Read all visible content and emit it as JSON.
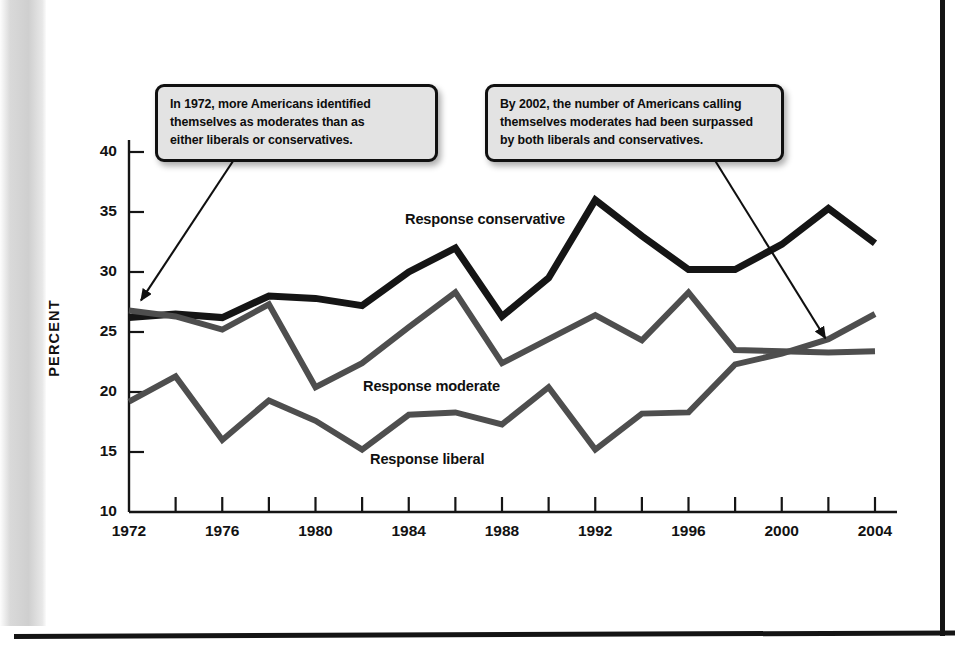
{
  "page": {
    "background_color": "#ffffff",
    "edge_color": "#141414",
    "gutter_color": "#d4d4d4"
  },
  "annotations": [
    {
      "id": "callout-1",
      "lines": [
        "In 1972, more Americans identified",
        "themselves as moderates than as",
        "either liberals or conservatives."
      ],
      "points_to": {
        "year": 1972,
        "value": 26.8
      }
    },
    {
      "id": "callout-2",
      "lines": [
        "By 2002, the number of Americans calling",
        "themselves moderates had been surpassed",
        "by both liberals and conservatives."
      ],
      "points_to": {
        "year": 2002,
        "value": 23.4
      }
    }
  ],
  "series_labels": {
    "conservative": "Response conservative",
    "moderate": "Response moderate",
    "liberal": "Response liberal"
  },
  "colors": {
    "conservative": "#151515",
    "moderate": "#4e4e4e",
    "liberal": "#4e4e4e",
    "axis": "#151515",
    "callout_fill": "#e3e3e3",
    "callout_border": "#101010"
  },
  "chart_data": {
    "type": "line",
    "title": "",
    "xlabel": "",
    "ylabel": "PERCENT",
    "xlim": [
      1972,
      2004
    ],
    "ylim": [
      10,
      40
    ],
    "grid": false,
    "legend": "inline-labels",
    "y_ticks": [
      10,
      15,
      20,
      25,
      30,
      35,
      40
    ],
    "y_tick_labels": [
      "10",
      "15",
      "20",
      "25",
      "30",
      "35",
      "40"
    ],
    "x_ticks": [
      1972,
      1974,
      1976,
      1978,
      1980,
      1982,
      1984,
      1986,
      1988,
      1990,
      1992,
      1994,
      1996,
      1998,
      2000,
      2002,
      2004
    ],
    "x_tick_labels": [
      "1972",
      "",
      "1976",
      "",
      "1980",
      "",
      "1984",
      "",
      "1988",
      "",
      "1992",
      "",
      "1996",
      "",
      "2000",
      "",
      "2004"
    ],
    "x_major_labels": [
      "1972",
      "1976",
      "1980",
      "1984",
      "1988",
      "1992",
      "1996",
      "2000",
      "2004"
    ],
    "x": [
      1972,
      1974,
      1976,
      1978,
      1980,
      1982,
      1984,
      1986,
      1988,
      1990,
      1992,
      1994,
      1996,
      1998,
      2000,
      2002,
      2004
    ],
    "series": [
      {
        "name": "Response conservative",
        "color": "#151515",
        "width": 7,
        "values": [
          26.2,
          26.5,
          26.2,
          28.0,
          27.8,
          27.2,
          30.0,
          32.0,
          26.3,
          29.5,
          36.0,
          33.0,
          30.2,
          30.2,
          32.3,
          35.3,
          32.4
        ]
      },
      {
        "name": "Response moderate",
        "color": "#4e4e4e",
        "width": 6,
        "values": [
          26.8,
          26.3,
          25.2,
          27.3,
          20.4,
          22.4,
          25.4,
          28.3,
          22.4,
          24.4,
          26.4,
          24.3,
          28.3,
          23.5,
          23.4,
          23.3,
          23.4
        ]
      },
      {
        "name": "Response liberal",
        "color": "#4e4e4e",
        "width": 6,
        "values": [
          19.2,
          21.3,
          16.0,
          19.3,
          17.6,
          15.2,
          18.1,
          18.3,
          17.3,
          20.4,
          15.2,
          18.2,
          18.3,
          22.3,
          23.2,
          24.4,
          26.5
        ]
      }
    ]
  }
}
